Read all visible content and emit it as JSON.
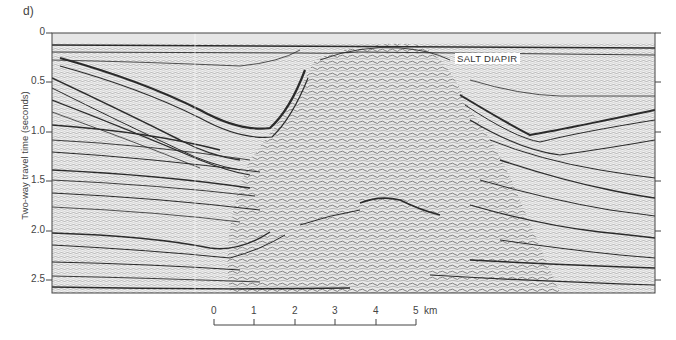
{
  "figure": {
    "panel_label": "d)",
    "annotation": "SALT DIAPIR",
    "y_axis": {
      "label": "Two-way travel time (seconds)",
      "ticks": [
        "0",
        "0.5",
        "1.0",
        "1.5",
        "2.0",
        "2.5"
      ],
      "range": [
        0,
        2.6
      ]
    },
    "scale_bar": {
      "ticks": [
        "0",
        "1",
        "2",
        "3",
        "4",
        "5"
      ],
      "unit": "km"
    },
    "colors": {
      "background": "#ffffff",
      "reflector": "#2b2b2b",
      "frame": "#444444"
    }
  }
}
